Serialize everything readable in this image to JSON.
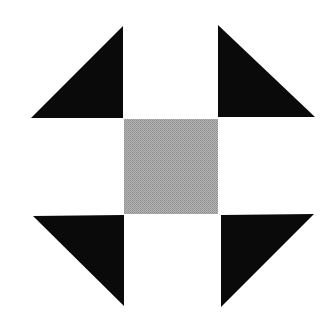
{
  "diagram": {
    "colors": {
      "background": "#ffffff",
      "triangle": "#0a0a0a",
      "center_square": "#a8a8a8",
      "center_square_dot": "#8a8a8a"
    },
    "shapes": {
      "triangle_top_left": {
        "points": "31,118 123,26 123,118"
      },
      "triangle_top_right": {
        "points": "218,25 315,117 218,117"
      },
      "center_square": {
        "x": 124,
        "y": 119,
        "width": 94,
        "height": 95
      },
      "triangle_bottom_left": {
        "points": "33,216 124,215 124,306"
      },
      "triangle_bottom_right": {
        "points": "221,215 314,214 221,307"
      }
    }
  }
}
